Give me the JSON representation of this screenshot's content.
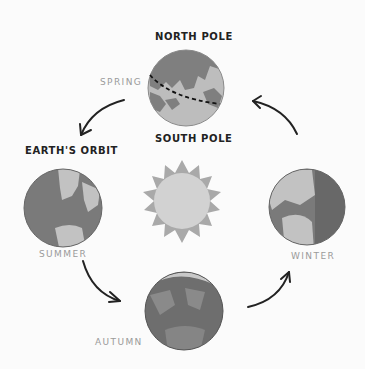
{
  "diagram": {
    "labels": {
      "north_pole": "NORTH POLE",
      "south_pole": "SOUTH POLE",
      "earths_orbit": "EARTH'S ORBIT"
    },
    "seasons": {
      "spring": "SPRING",
      "summer": "SUMMER",
      "autumn": "AUTUMN",
      "winter": "WINTER"
    },
    "colors": {
      "background": "#fbfbfb",
      "ocean": "#7a7a7a",
      "land": "#bdbdbd",
      "sun_rays": "#a9a9a9",
      "sun_core": "#cfcfcf",
      "arrow": "#222222",
      "season_text": "#9a9a9a",
      "title_text": "#222222"
    },
    "icons": [
      "sun-icon",
      "earth-globe-icon",
      "orbit-arrow-icon",
      "equator-dashed-line"
    ]
  }
}
